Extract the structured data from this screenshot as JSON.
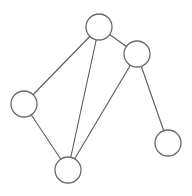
{
  "diagram": {
    "type": "undirected-graph",
    "style": {
      "background": "#ffffff",
      "edge_color": "#5a5a5a",
      "node_stroke": "#6a6a6a",
      "node_fill": "#ffffff",
      "node_radius": 13
    },
    "nodes": [
      {
        "id": "n1",
        "x": 99,
        "y": 27
      },
      {
        "id": "n2",
        "x": 137,
        "y": 54
      },
      {
        "id": "n3",
        "x": 24,
        "y": 104
      },
      {
        "id": "n4",
        "x": 68,
        "y": 170
      },
      {
        "id": "n5",
        "x": 168,
        "y": 143
      }
    ],
    "edges": [
      {
        "from": "n1",
        "to": "n3"
      },
      {
        "from": "n1",
        "to": "n2"
      },
      {
        "from": "n1",
        "to": "n4"
      },
      {
        "from": "n2",
        "to": "n4"
      },
      {
        "from": "n2",
        "to": "n5"
      },
      {
        "from": "n3",
        "to": "n4"
      }
    ]
  }
}
